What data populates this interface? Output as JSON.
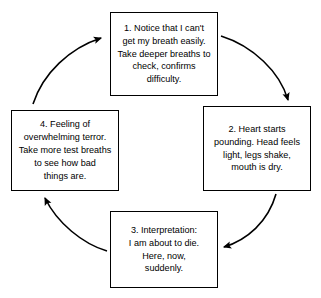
{
  "diagram": {
    "type": "cyclical-flow",
    "direction": "clockwise",
    "colors": {
      "background": "#ffffff",
      "box_border": "#000000",
      "text": "#000000",
      "arrow": "#000000"
    },
    "nodes": [
      {
        "id": "node-1",
        "number": "1",
        "position": "top",
        "text": "1. Notice that I can't\nget my breath easily.\nTake deeper breaths to\ncheck, confirms\ndifficulty."
      },
      {
        "id": "node-2",
        "number": "2",
        "position": "right",
        "text": "2. Heart starts\npounding. Head feels\nlight, legs shake,\nmouth is dry."
      },
      {
        "id": "node-3",
        "number": "3",
        "position": "bottom",
        "text": "3. Interpretation:\nI am about to die.\nHere, now,\nsuddenly."
      },
      {
        "id": "node-4",
        "number": "4",
        "position": "left",
        "text": "4. Feeling of\noverwhelming terror.\nTake more test breaths\nto see how bad\nthings are."
      }
    ],
    "arrows": [
      {
        "id": "arrow-1-to-2",
        "from": "node-1",
        "to": "node-2",
        "label": ""
      },
      {
        "id": "arrow-2-to-3",
        "from": "node-2",
        "to": "node-3",
        "label": ""
      },
      {
        "id": "arrow-3-to-4",
        "from": "node-3",
        "to": "node-4",
        "label": ""
      },
      {
        "id": "arrow-4-to-1",
        "from": "node-4",
        "to": "node-1",
        "label": ""
      }
    ]
  }
}
